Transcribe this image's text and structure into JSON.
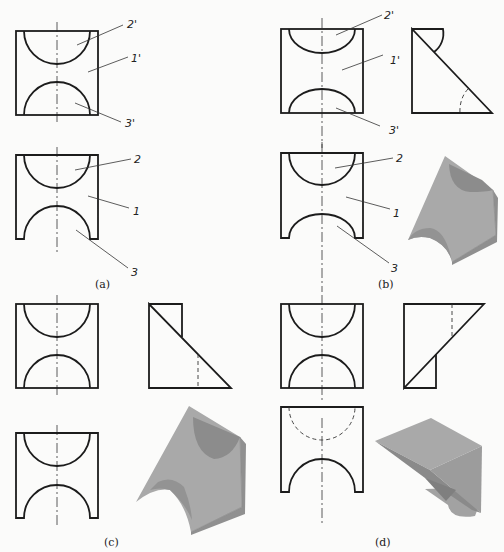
{
  "figure": {
    "panels": [
      {
        "id": "a",
        "caption": "(a)",
        "front_view_labels": [
          "2'",
          "1'",
          "3'"
        ],
        "top_view_labels": [
          "2",
          "1",
          "3"
        ]
      },
      {
        "id": "b",
        "caption": "(b)",
        "front_view_labels": [
          "2'",
          "1'",
          "3'"
        ],
        "top_view_labels": [
          "2",
          "1",
          "3"
        ],
        "side_view": "right-triangle with arc cutout",
        "isometric": "shaded solid"
      },
      {
        "id": "c",
        "caption": "(c)",
        "side_view": "triangle with rectangle, hidden line",
        "isometric": "shaded solid"
      },
      {
        "id": "d",
        "caption": "(d)",
        "side_view": "inverted triangle with rectangle, hidden line",
        "top_view_hidden_arc": true,
        "isometric": "shaded solid"
      }
    ],
    "colors": {
      "line": "#1c1c1c",
      "solid_face_light": "#a9a9a9",
      "solid_face_mid": "#9a9a9a",
      "solid_face_dark": "#8c8c8c",
      "background": "#fbfbfa"
    }
  }
}
